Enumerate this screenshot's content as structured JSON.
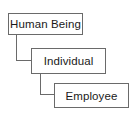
{
  "diagram": {
    "type": "hierarchy",
    "nodes": [
      {
        "label": "Human Being"
      },
      {
        "label": "Individual"
      },
      {
        "label": "Employee"
      }
    ],
    "edges": [
      {
        "from": "Human Being",
        "to": "Individual"
      },
      {
        "from": "Individual",
        "to": "Employee"
      }
    ],
    "colors": {
      "border": "#6a6a6a",
      "text": "#1a1a1a",
      "background": "#ffffff"
    }
  }
}
